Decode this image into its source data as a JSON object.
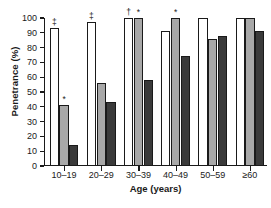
{
  "chart_data": {
    "type": "bar",
    "title": "",
    "xlabel": "Age (years)",
    "ylabel": "Penetrance (%)",
    "categories": [
      "10–19",
      "20–29",
      "30–39",
      "40–49",
      "50–59",
      "≥60"
    ],
    "ylim": [
      0,
      100
    ],
    "yticks": [
      0,
      10,
      20,
      30,
      40,
      50,
      60,
      70,
      80,
      90,
      100
    ],
    "grid": false,
    "legend": "none",
    "series": [
      {
        "name": "series-1-white",
        "color": "#ffffff",
        "values": [
          93,
          97,
          100,
          91,
          100,
          100
        ]
      },
      {
        "name": "series-2-gray",
        "color": "#a8a8a8",
        "values": [
          41,
          56,
          100,
          100,
          86,
          100
        ]
      },
      {
        "name": "series-3-dark",
        "color": "#3a3a3a",
        "values": [
          14,
          43,
          58,
          74,
          88,
          91
        ]
      }
    ],
    "annotations": [
      {
        "category": "10–19",
        "series": 0,
        "symbol": "‡"
      },
      {
        "category": "10–19",
        "series": 1,
        "symbol": "*"
      },
      {
        "category": "20–29",
        "series": 0,
        "symbol": "‡"
      },
      {
        "category": "30–39",
        "series": 0,
        "symbol": "†"
      },
      {
        "category": "30–39",
        "series": 1,
        "symbol": "*"
      },
      {
        "category": "40–49",
        "series": 1,
        "symbol": "*"
      }
    ]
  },
  "figure": {
    "title_fragment": "",
    "footnote": ""
  }
}
